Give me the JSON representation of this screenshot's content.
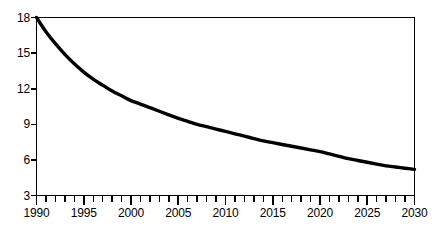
{
  "chart_data": {
    "type": "line",
    "title": "",
    "subtitle": "",
    "xlabel": "",
    "ylabel": "",
    "xlim": [
      1990,
      2030
    ],
    "ylim": [
      3,
      18
    ],
    "grid": false,
    "legend": null,
    "line_color": "#000000",
    "frame_color": "#000000",
    "background": "#ffffff",
    "y_ticks": [
      3,
      6,
      9,
      12,
      15,
      18
    ],
    "y_tick_labels": [
      "3",
      "6",
      "9",
      "12",
      "15",
      "18"
    ],
    "x_tick_labels": [
      "1990",
      "1995",
      "2000",
      "2005",
      "2010",
      "2015",
      "2020",
      "2025",
      "2030"
    ],
    "x_minor_tick_interval": 1,
    "x_major_tick_interval": 5,
    "series": [
      {
        "name": "",
        "x": [
          1990,
          1991,
          1992,
          1993,
          1994,
          1995,
          1996,
          1997,
          1998,
          1999,
          2000,
          2001,
          2002,
          2003,
          2004,
          2005,
          2006,
          2007,
          2008,
          2009,
          2010,
          2011,
          2012,
          2013,
          2014,
          2015,
          2016,
          2017,
          2018,
          2019,
          2020,
          2021,
          2022,
          2023,
          2024,
          2025,
          2026,
          2027,
          2028,
          2029,
          2030
        ],
        "values": [
          18.0,
          16.8,
          15.8,
          14.9,
          14.1,
          13.4,
          12.8,
          12.3,
          11.8,
          11.4,
          11.0,
          10.7,
          10.4,
          10.1,
          9.8,
          9.5,
          9.25,
          9.0,
          8.8,
          8.6,
          8.4,
          8.2,
          8.0,
          7.8,
          7.6,
          7.45,
          7.3,
          7.15,
          7.0,
          6.85,
          6.7,
          6.5,
          6.3,
          6.1,
          5.95,
          5.8,
          5.65,
          5.5,
          5.4,
          5.3,
          5.2
        ]
      }
    ]
  }
}
